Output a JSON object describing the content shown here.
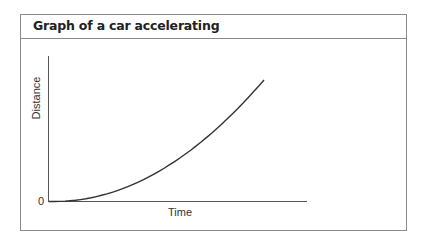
{
  "panel": {
    "title": "Graph of a car accelerating"
  },
  "axes": {
    "x_label": "Time",
    "y_label": "Distance",
    "origin_label": "0"
  },
  "colors": {
    "border": "#8a8a8a",
    "axis": "#555555",
    "curve": "#333333"
  },
  "chart_data": {
    "type": "line",
    "title": "Graph of a car accelerating",
    "xlabel": "Time",
    "ylabel": "Distance",
    "x_tick_labels": [],
    "y_tick_labels": [
      "0"
    ],
    "grid": false,
    "legend": null,
    "series": [
      {
        "name": "Distance vs time (accelerating)",
        "shape": "quadratic (d ∝ t²)",
        "x": [
          0,
          0.1,
          0.2,
          0.3,
          0.4,
          0.5,
          0.6,
          0.7,
          0.8,
          0.9,
          1.0
        ],
        "values": [
          0,
          0.01,
          0.04,
          0.09,
          0.16,
          0.25,
          0.36,
          0.49,
          0.64,
          0.81,
          1.0
        ]
      }
    ],
    "xlim": [
      0,
      1.2
    ],
    "ylim": [
      0,
      1.15
    ],
    "note": "Axes unlabeled numerically apart from origin 0; values normalized"
  }
}
